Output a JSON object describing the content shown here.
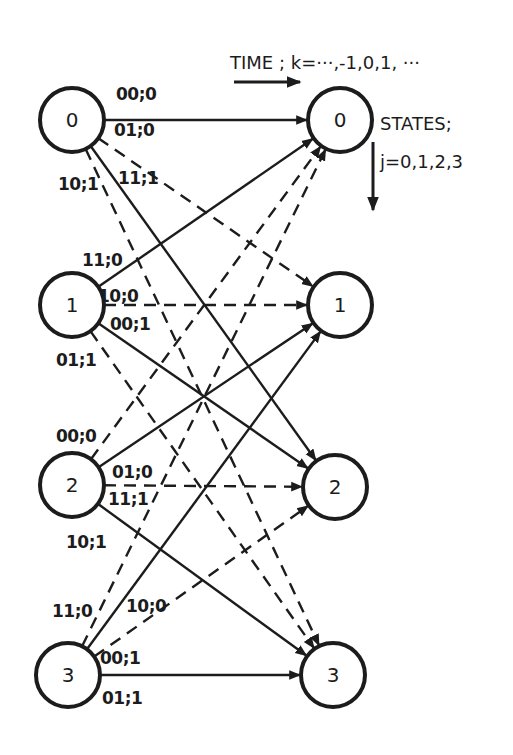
{
  "diagram": {
    "type": "trellis",
    "time_label": "TIME ; k=···,-1,0,1, ···",
    "states_label": "STATES;",
    "states_sub_label": "j=0,1,2,3",
    "left_states": [
      "0",
      "1",
      "2",
      "3"
    ],
    "right_states": [
      "0",
      "1",
      "2",
      "3"
    ],
    "edges": [
      {
        "from": 0,
        "to": 0,
        "style": "solid",
        "label": "00;0"
      },
      {
        "from": 0,
        "to": 1,
        "style": "dashed",
        "label": "01;0"
      },
      {
        "from": 0,
        "to": 2,
        "style": "solid",
        "label": "11;1"
      },
      {
        "from": 0,
        "to": 3,
        "style": "dashed",
        "label": "10;1"
      },
      {
        "from": 1,
        "to": 0,
        "style": "solid",
        "label": "11;0"
      },
      {
        "from": 1,
        "to": 1,
        "style": "dashed",
        "label": "10;0"
      },
      {
        "from": 1,
        "to": 2,
        "style": "solid",
        "label": "00;1"
      },
      {
        "from": 1,
        "to": 3,
        "style": "dashed",
        "label": "01;1"
      },
      {
        "from": 2,
        "to": 0,
        "style": "dashed",
        "label": "00;0"
      },
      {
        "from": 2,
        "to": 1,
        "style": "solid",
        "label": "01;0"
      },
      {
        "from": 2,
        "to": 2,
        "style": "dashed",
        "label": "11;1"
      },
      {
        "from": 2,
        "to": 3,
        "style": "solid",
        "label": "10;1"
      },
      {
        "from": 3,
        "to": 0,
        "style": "dashed",
        "label": "11;0"
      },
      {
        "from": 3,
        "to": 1,
        "style": "solid",
        "label": "10;0"
      },
      {
        "from": 3,
        "to": 2,
        "style": "dashed",
        "label": "00;1"
      },
      {
        "from": 3,
        "to": 3,
        "style": "solid",
        "label": "01;1"
      }
    ]
  }
}
